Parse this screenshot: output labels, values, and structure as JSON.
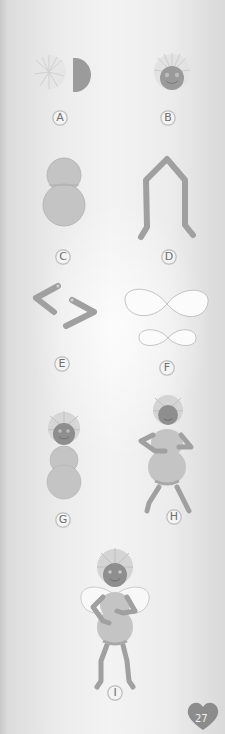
{
  "page": {
    "type": "craft-instructions",
    "page_number": "27",
    "colors": {
      "background": "#ececec",
      "body_gray": "#9a9a9a",
      "torso_light": "#c2c2c2",
      "hair": "#cfcfcf",
      "wing_fill": "#fafafa",
      "label_text": "#6e6e6e",
      "badge": "#8c8c8c"
    }
  },
  "steps": [
    {
      "id": "A",
      "label": "A",
      "description": "fluffy hair pom-pom beside half-circle head"
    },
    {
      "id": "B",
      "label": "B",
      "description": "round face with hair attached"
    },
    {
      "id": "C",
      "label": "C",
      "description": "two-part light body shape"
    },
    {
      "id": "D",
      "label": "D",
      "description": "bent pipe-cleaner legs"
    },
    {
      "id": "E",
      "label": "E",
      "description": "two bent pipe-cleaner arms"
    },
    {
      "id": "F",
      "label": "F",
      "description": "large and small figure-eight wings"
    },
    {
      "id": "G",
      "label": "G",
      "description": "head attached to body"
    },
    {
      "id": "H",
      "label": "H",
      "description": "figure with arms and legs"
    },
    {
      "id": "I",
      "label": "I",
      "description": "finished fairy with wings"
    }
  ]
}
